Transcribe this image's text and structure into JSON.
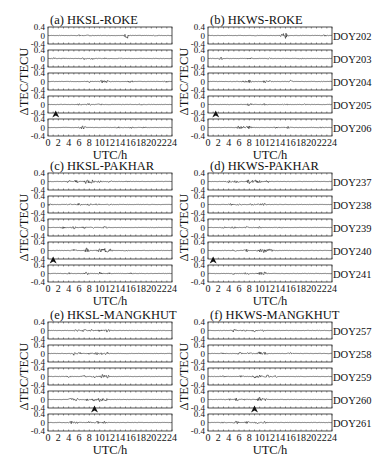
{
  "chart_data": [
    {
      "type": "line",
      "panel": "a",
      "title": "(a) HKSL-ROKE",
      "xlabel": "UTC/h",
      "ylabel": "ΔTEC/TECU",
      "xlim": [
        0,
        24
      ],
      "ylim": [
        -0.4,
        0.4
      ],
      "xticks": [
        "0",
        "2",
        "4",
        "6",
        "8",
        "10",
        "12",
        "14",
        "16",
        "18",
        "20",
        "22",
        "24"
      ],
      "yticks": [
        "0.4",
        "0",
        "-0.4"
      ],
      "series": [
        {
          "name": "DOY202",
          "bursts": [
            [
              6.2,
              0.05
            ],
            [
              15.3,
              0.15
            ],
            [
              8,
              0.03
            ],
            [
              21,
              0.02
            ]
          ]
        },
        {
          "name": "DOY203",
          "bursts": [
            [
              1,
              0.04
            ],
            [
              3,
              0.03
            ],
            [
              7,
              0.05
            ],
            [
              8.5,
              0.04
            ],
            [
              11,
              0.03
            ],
            [
              14,
              0.03
            ]
          ]
        },
        {
          "name": "DOY204",
          "bursts": [
            [
              8,
              0.05
            ],
            [
              10.5,
              0.07
            ],
            [
              11.5,
              0.06
            ],
            [
              16,
              0.06
            ],
            [
              23,
              0.03
            ]
          ]
        },
        {
          "name": "DOY205",
          "bursts": [
            [
              6,
              0.04
            ],
            [
              8,
              0.06
            ],
            [
              10,
              0.03
            ],
            [
              18,
              0.03
            ]
          ]
        },
        {
          "name": "DOY206",
          "bursts": [
            [
              6.5,
              0.07
            ],
            [
              7,
              0.06
            ],
            [
              13.5,
              0.05
            ],
            [
              16,
              0.04
            ],
            [
              18.5,
              0.03
            ]
          ]
        }
      ],
      "annotations": [
        {
          "type": "arrow",
          "x": 1.5,
          "between_rows": [
            3,
            4
          ]
        }
      ]
    },
    {
      "type": "line",
      "panel": "b",
      "title": "(b) HKWS-ROKE",
      "xlabel": "UTC/h",
      "xlim": [
        0,
        24
      ],
      "ylim": [
        -0.4,
        0.4
      ],
      "xticks": [
        "0",
        "2",
        "4",
        "6",
        "8",
        "10",
        "12",
        "14",
        "16",
        "18",
        "20",
        "22",
        "24"
      ],
      "yticks": [
        "0.4",
        "0",
        "-0.4"
      ],
      "series": [
        {
          "name": "DOY202",
          "bursts": [
            [
              14.5,
              0.12
            ],
            [
              15,
              0.1
            ],
            [
              9,
              0.03
            ],
            [
              22.5,
              0.04
            ]
          ]
        },
        {
          "name": "DOY203",
          "bursts": [
            [
              2.5,
              0.06
            ],
            [
              8,
              0.04
            ],
            [
              12,
              0.03
            ],
            [
              18,
              0.02
            ]
          ]
        },
        {
          "name": "DOY204",
          "bursts": [
            [
              7,
              0.04
            ],
            [
              8,
              0.07
            ],
            [
              11,
              0.06
            ],
            [
              12,
              0.05
            ],
            [
              16,
              0.06
            ]
          ]
        },
        {
          "name": "DOY205",
          "bursts": [
            [
              8,
              0.07
            ],
            [
              11,
              0.04
            ],
            [
              15,
              0.04
            ],
            [
              19,
              0.03
            ]
          ]
        },
        {
          "name": "DOY206",
          "bursts": [
            [
              6,
              0.08
            ],
            [
              7,
              0.09
            ],
            [
              8,
              0.08
            ],
            [
              13,
              0.04
            ],
            [
              15.5,
              0.05
            ],
            [
              22,
              0.03
            ]
          ]
        }
      ],
      "right_labels": [
        "DOY202",
        "DOY203",
        "DOY204",
        "DOY205",
        "DOY206"
      ],
      "annotations": [
        {
          "type": "arrow",
          "x": 1.5,
          "between_rows": [
            3,
            4
          ]
        }
      ]
    },
    {
      "type": "line",
      "panel": "c",
      "title": "(c) HKSL-PAKHAR",
      "xlabel": "UTC/h",
      "ylabel": "ΔTEC/TECU",
      "xlim": [
        0,
        24
      ],
      "ylim": [
        -0.4,
        0.4
      ],
      "xticks": [
        "0",
        "2",
        "4",
        "6",
        "8",
        "10",
        "12",
        "14",
        "16",
        "18",
        "20",
        "22",
        "24"
      ],
      "yticks": [
        "0.4",
        "0",
        "-0.4"
      ],
      "series": [
        {
          "name": "DOY237",
          "bursts": [
            [
              4,
              0.06
            ],
            [
              5.5,
              0.08
            ],
            [
              7.5,
              0.14
            ],
            [
              8.5,
              0.1
            ],
            [
              10,
              0.08
            ],
            [
              12,
              0.05
            ],
            [
              15.5,
              0.03
            ]
          ]
        },
        {
          "name": "DOY238",
          "bursts": [
            [
              0.3,
              0.05
            ],
            [
              4,
              0.05
            ],
            [
              6,
              0.06
            ],
            [
              8,
              0.05
            ],
            [
              9.5,
              0.05
            ],
            [
              12,
              0.03
            ]
          ]
        },
        {
          "name": "DOY239",
          "bursts": [
            [
              3,
              0.05
            ],
            [
              5,
              0.06
            ],
            [
              7,
              0.06
            ],
            [
              8.5,
              0.05
            ],
            [
              11,
              0.07
            ]
          ]
        },
        {
          "name": "DOY240",
          "bursts": [
            [
              5,
              0.05
            ],
            [
              7.5,
              0.12
            ],
            [
              10,
              0.1
            ],
            [
              11,
              0.13
            ],
            [
              12,
              0.08
            ],
            [
              15,
              0.03
            ]
          ]
        },
        {
          "name": "DOY241",
          "bursts": [
            [
              4,
              0.04
            ],
            [
              7.5,
              0.07
            ],
            [
              10,
              0.06
            ],
            [
              12,
              0.04
            ],
            [
              16,
              0.03
            ]
          ]
        }
      ],
      "annotations": [
        {
          "type": "arrow",
          "x": 1.0,
          "between_rows": [
            3,
            4
          ]
        }
      ]
    },
    {
      "type": "line",
      "panel": "d",
      "title": "(d) HKWS-PAKHAR",
      "xlabel": "UTC/h",
      "xlim": [
        0,
        24
      ],
      "ylim": [
        -0.4,
        0.4
      ],
      "xticks": [
        "0",
        "2",
        "4",
        "6",
        "8",
        "10",
        "12",
        "14",
        "16",
        "18",
        "20",
        "22",
        "24"
      ],
      "yticks": [
        "0.4",
        "0",
        "-0.4"
      ],
      "series": [
        {
          "name": "DOY237",
          "bursts": [
            [
              4,
              0.06
            ],
            [
              5.5,
              0.06
            ],
            [
              8,
              0.1
            ],
            [
              9,
              0.09
            ],
            [
              10,
              0.08
            ],
            [
              11.5,
              0.06
            ]
          ]
        },
        {
          "name": "DOY238",
          "bursts": [
            [
              4.5,
              0.06
            ],
            [
              6,
              0.05
            ],
            [
              8.5,
              0.06
            ],
            [
              10,
              0.06
            ],
            [
              11,
              0.05
            ]
          ]
        },
        {
          "name": "DOY239",
          "bursts": [
            [
              3,
              0.04
            ],
            [
              5,
              0.06
            ],
            [
              7.5,
              0.05
            ],
            [
              10,
              0.05
            ],
            [
              14,
              0.03
            ]
          ]
        },
        {
          "name": "DOY240",
          "bursts": [
            [
              5,
              0.05
            ],
            [
              7.5,
              0.07
            ],
            [
              10,
              0.1
            ],
            [
              11,
              0.14
            ],
            [
              12,
              0.08
            ]
          ]
        },
        {
          "name": "DOY241",
          "bursts": [
            [
              5,
              0.05
            ],
            [
              7.5,
              0.06
            ],
            [
              10,
              0.08
            ],
            [
              11,
              0.07
            ]
          ]
        }
      ],
      "right_labels": [
        "DOY237",
        "DOY238",
        "DOY239",
        "DOY240",
        "DOY241"
      ],
      "annotations": [
        {
          "type": "arrow",
          "x": 1.0,
          "between_rows": [
            3,
            4
          ]
        }
      ]
    },
    {
      "type": "line",
      "panel": "e",
      "title": "(e) HKSL-MANGKHUT",
      "xlabel": "UTC/h",
      "ylabel": "ΔTEC/TECU",
      "xlim": [
        0,
        24
      ],
      "ylim": [
        -0.4,
        0.4
      ],
      "xticks": [
        "0",
        "2",
        "4",
        "6",
        "8",
        "10",
        "12",
        "14",
        "16",
        "18",
        "20",
        "22",
        "24"
      ],
      "yticks": [
        "0.4",
        "0",
        "-0.4"
      ],
      "series": [
        {
          "name": "DOY257",
          "bursts": [
            [
              5.5,
              0.05
            ],
            [
              7,
              0.07
            ],
            [
              8.5,
              0.06
            ],
            [
              10,
              0.05
            ],
            [
              11.5,
              0.08
            ]
          ]
        },
        {
          "name": "DOY258",
          "bursts": [
            [
              5,
              0.08
            ],
            [
              6,
              0.07
            ],
            [
              8,
              0.06
            ],
            [
              9.5,
              0.07
            ],
            [
              10.5,
              0.1
            ],
            [
              11.5,
              0.07
            ]
          ]
        },
        {
          "name": "DOY259",
          "bursts": [
            [
              4,
              0.04
            ],
            [
              7,
              0.05
            ],
            [
              9,
              0.06
            ],
            [
              10.5,
              0.09
            ],
            [
              11.5,
              0.07
            ]
          ]
        },
        {
          "name": "DOY260",
          "bursts": [
            [
              4.5,
              0.06
            ],
            [
              5.5,
              0.07
            ],
            [
              7.5,
              0.06
            ],
            [
              9,
              0.09
            ],
            [
              10,
              0.1
            ],
            [
              11,
              0.09
            ]
          ]
        },
        {
          "name": "DOY261",
          "bursts": [
            [
              4.5,
              0.06
            ],
            [
              5.5,
              0.06
            ],
            [
              8,
              0.05
            ],
            [
              9.5,
              0.07
            ],
            [
              11,
              0.06
            ]
          ]
        }
      ],
      "annotations": [
        {
          "type": "arrow",
          "x": 9.0,
          "between_rows": [
            3,
            4
          ]
        }
      ]
    },
    {
      "type": "line",
      "panel": "f",
      "title": "(f) HKWS-MANGKHUT",
      "xlabel": "UTC/h",
      "xlim": [
        0,
        24
      ],
      "ylim": [
        -0.4,
        0.4
      ],
      "xticks": [
        "0",
        "2",
        "4",
        "6",
        "8",
        "10",
        "12",
        "14",
        "16",
        "18",
        "20",
        "22",
        "24"
      ],
      "yticks": [
        "0.4",
        "0",
        "-0.4"
      ],
      "series": [
        {
          "name": "DOY257",
          "bursts": [
            [
              5,
              0.08
            ],
            [
              7,
              0.05
            ],
            [
              9,
              0.06
            ],
            [
              10.5,
              0.05
            ]
          ]
        },
        {
          "name": "DOY258",
          "bursts": [
            [
              3,
              0.04
            ],
            [
              6,
              0.07
            ],
            [
              8,
              0.06
            ],
            [
              10,
              0.1
            ],
            [
              11,
              0.08
            ],
            [
              16,
              0.04
            ]
          ]
        },
        {
          "name": "DOY259",
          "bursts": [
            [
              3,
              0.05
            ],
            [
              6.5,
              0.06
            ],
            [
              9,
              0.07
            ],
            [
              10,
              0.1
            ],
            [
              11.5,
              0.08
            ],
            [
              13,
              0.05
            ]
          ]
        },
        {
          "name": "DOY260",
          "bursts": [
            [
              4,
              0.05
            ],
            [
              5.5,
              0.06
            ],
            [
              7,
              0.05
            ],
            [
              10,
              0.12
            ],
            [
              11,
              0.06
            ]
          ]
        },
        {
          "name": "DOY261",
          "bursts": [
            [
              3,
              0.04
            ],
            [
              5.5,
              0.07
            ],
            [
              7.5,
              0.06
            ],
            [
              9.5,
              0.06
            ],
            [
              11,
              0.05
            ]
          ]
        }
      ],
      "right_labels": [
        "DOY257",
        "DOY258",
        "DOY259",
        "DOY260",
        "DOY261"
      ],
      "annotations": [
        {
          "type": "arrow",
          "x": 9.0,
          "between_rows": [
            3,
            4
          ]
        }
      ]
    }
  ],
  "labels": {
    "x_axis": "UTC/h",
    "y_axis": "ΔTEC/TECU"
  },
  "layout": {
    "columns_x": [
      48,
      208
    ],
    "plot_width": 124,
    "panel_tops": [
      27,
      173,
      322
    ],
    "row_height": 17,
    "row_step": 23,
    "line_color": "#222222"
  }
}
